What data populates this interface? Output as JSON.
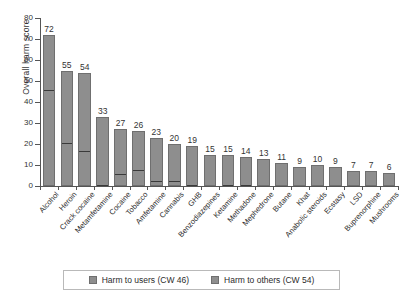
{
  "chart_data": {
    "type": "bar",
    "stacked": true,
    "title": "",
    "xlabel": "",
    "ylabel": "Overall harm score",
    "ylim": [
      0,
      80
    ],
    "yticks": [
      0,
      10,
      20,
      30,
      40,
      50,
      60,
      70,
      80
    ],
    "grid": false,
    "legend_position": "bottom",
    "categories": [
      "Alcohol",
      "Heroin",
      "Crack cocaine",
      "Metamfetamine",
      "Cocaine",
      "Tobacco",
      "Amfetamine",
      "Cannabis",
      "GHB",
      "Benzodiazepines",
      "Ketamine",
      "Methadone",
      "Mephedrone",
      "Butane",
      "Khat",
      "Anabolic steroids",
      "Ecstasy",
      "LSD",
      "Buprenorphine",
      "Mushrooms"
    ],
    "totals": [
      72,
      55,
      54,
      33,
      27,
      26,
      23,
      20,
      19,
      15,
      15,
      14,
      13,
      11,
      9,
      10,
      9,
      7,
      7,
      6
    ],
    "series": [
      {
        "name": "Harm to users (CW 46)",
        "color": "#8e8e8e",
        "values": [
          26,
          34,
          37,
          32,
          21,
          18,
          20,
          17,
          18,
          15,
          14,
          13,
          13,
          11,
          9,
          10,
          9,
          7,
          7,
          6
        ]
      },
      {
        "name": "Harm to others (CW 54)",
        "color": "#8e8e8e",
        "values": [
          46,
          21,
          17,
          1,
          6,
          8,
          3,
          3,
          1,
          0,
          1,
          1,
          0,
          0,
          0,
          0,
          0,
          0,
          0,
          0
        ]
      }
    ],
    "bar_labels": [
      "72",
      "55",
      "54",
      "33",
      "27",
      "26",
      "23",
      "20",
      "19",
      "15",
      "15",
      "14",
      "13",
      "11",
      "9",
      "10",
      "9",
      "7",
      "7",
      "6"
    ],
    "ytick_labels": [
      "0",
      "10",
      "20",
      "30",
      "40",
      "50",
      "60",
      "70",
      "80"
    ]
  },
  "legend": {
    "items": [
      {
        "label": "Harm to users (CW 46)",
        "swatch": "#8e8e8e"
      },
      {
        "label": "Harm to others (CW 54)",
        "swatch": "#8e8e8e"
      }
    ]
  },
  "colors": {
    "bar_fill": "#8e8e8e",
    "bar_stroke": "#6f6f6f",
    "split_line": "#3a3a3a",
    "axis": "#555555",
    "text": "#2b2b2b",
    "background": "#ffffff"
  }
}
